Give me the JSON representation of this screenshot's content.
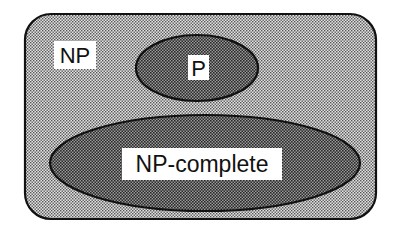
{
  "diagram": {
    "type": "venn",
    "title": "",
    "sets": [
      {
        "id": "np",
        "label": "NP",
        "shape": "rounded-rectangle",
        "fill": "#c8c8c8",
        "contains": [
          "p",
          "np-complete"
        ]
      },
      {
        "id": "p",
        "label": "P",
        "shape": "ellipse",
        "fill": "#8f8f8f"
      },
      {
        "id": "np-complete",
        "label": "NP-complete",
        "shape": "ellipse",
        "fill": "#8f8f8f"
      }
    ],
    "colors": {
      "outline": "#111111",
      "outer_fill": "#c8c8c8",
      "inner_fill": "#8f8f8f",
      "label_bg": "#ffffff"
    }
  }
}
